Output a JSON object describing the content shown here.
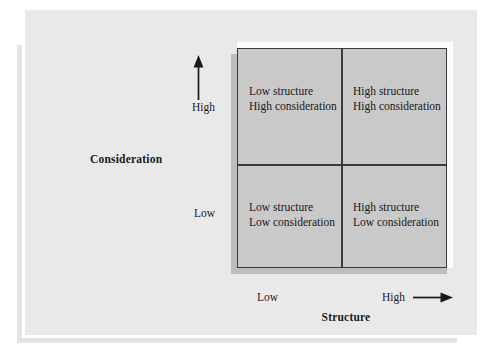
{
  "figure": {
    "background_color": "#e9e9e9",
    "matrix_fill_color": "#c9c9c9",
    "line_color": "#3a3a3a",
    "text_color": "#191919"
  },
  "matrix": {
    "quadrants": [
      {
        "position": "top-left",
        "structure": "Low structure",
        "consideration": "High consideration",
        "text": "Low structure\nHigh consideration"
      },
      {
        "position": "top-right",
        "structure": "High structure",
        "consideration": "High consideration",
        "text": "High structure\nHigh consideration"
      },
      {
        "position": "bottom-left",
        "structure": "Low structure",
        "consideration": "Low consideration",
        "text": "Low structure\nLow consideration"
      },
      {
        "position": "bottom-right",
        "structure": "High structure",
        "consideration": "Low consideration",
        "text": "High structure\nLow consideration"
      }
    ]
  },
  "axes": {
    "vertical": {
      "title": "Consideration",
      "high_label": "High",
      "low_label": "Low",
      "arrow_direction": "up",
      "arrow_icon": "arrow-up-icon"
    },
    "horizontal": {
      "title": "Structure",
      "low_label": "Low",
      "high_label": "High",
      "arrow_direction": "right",
      "arrow_icon": "arrow-right-icon"
    }
  }
}
